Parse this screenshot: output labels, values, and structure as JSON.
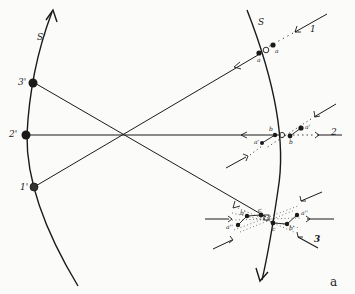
{
  "figure": {
    "caption": "a",
    "arcs": {
      "left": {
        "label": "S'"
      },
      "right": {
        "label": "S"
      }
    },
    "points_left": [
      {
        "label": "3'"
      },
      {
        "label": "2'"
      },
      {
        "label": "1'"
      }
    ],
    "rays": [
      {
        "label": "1"
      },
      {
        "label": "2"
      },
      {
        "label": "3"
      }
    ],
    "images_ray1": {
      "a_left": "a",
      "a_right": "a"
    },
    "images_ray2": {
      "b_left": "b",
      "b_right": "b",
      "a_prime_left": "a'",
      "a_prime_right": "a'"
    },
    "images_ray3": {
      "c_top": "c",
      "c_bottom": "c",
      "b_prime_left": "b'",
      "b_prime_right": "b'",
      "a_dprime_left": "a''",
      "a_dprime_right": "a''"
    },
    "colors": {
      "ink": "#1a1a1a",
      "background": "#fbfbfa"
    }
  }
}
